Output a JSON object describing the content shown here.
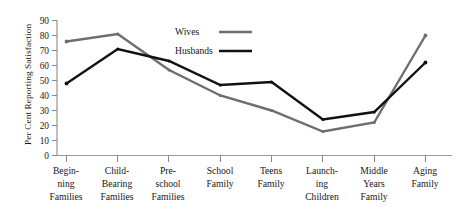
{
  "chart_data": {
    "type": "line",
    "title": "",
    "xlabel": "",
    "ylabel": "Per Cent Reporting Satisfaction",
    "ylim": [
      0,
      90
    ],
    "ytick_values": [
      0,
      10,
      20,
      30,
      40,
      50,
      60,
      70,
      80,
      90
    ],
    "ytick_labels": [
      "0",
      "10",
      "20",
      "30",
      "40",
      "50",
      "60",
      "70",
      "80",
      "90"
    ],
    "grid": false,
    "legend_position": "upper-center",
    "categories": [
      "Beginning Families",
      "Child-Bearing Families",
      "Pre-school Families",
      "School Family",
      "Teens Family",
      "Launching Children",
      "Middle Years Family",
      "Aging Family"
    ],
    "category_lines": [
      [
        "Begin-",
        "ning",
        "Families"
      ],
      [
        "Child-",
        "Bearing",
        "Families"
      ],
      [
        "Pre-",
        "school",
        "Families"
      ],
      [
        "School",
        "Family"
      ],
      [
        "Teens",
        "Family"
      ],
      [
        "Launch-",
        "ing",
        "Children"
      ],
      [
        "Middle",
        "Years",
        "Family"
      ],
      [
        "Aging",
        "Family"
      ]
    ],
    "series": [
      {
        "name": "Wives",
        "color": "#6e6e6e",
        "values": [
          76,
          81,
          57,
          40,
          30,
          16,
          22,
          80
        ]
      },
      {
        "name": "Husbands",
        "color": "#111111",
        "values": [
          48,
          71,
          63,
          47,
          49,
          24,
          29,
          62
        ]
      }
    ]
  },
  "axes": {
    "y_axis_label": "Per Cent Reporting Satisfaction",
    "y_ticks": [
      "90",
      "80",
      "70",
      "60",
      "50",
      "40",
      "30",
      "20",
      "10",
      "0"
    ]
  },
  "legend": {
    "entries": [
      {
        "label": "Wives",
        "color": "#6e6e6e"
      },
      {
        "label": "Husbands",
        "color": "#111111"
      }
    ]
  },
  "xcats": {
    "c0_l0": "Begin-",
    "c0_l1": "ning",
    "c0_l2": "Families",
    "c1_l0": "Child-",
    "c1_l1": "Bearing",
    "c1_l2": "Families",
    "c2_l0": "Pre-",
    "c2_l1": "school",
    "c2_l2": "Families",
    "c3_l0": "School",
    "c3_l1": "Family",
    "c3_l2": "",
    "c4_l0": "Teens",
    "c4_l1": "Family",
    "c4_l2": "",
    "c5_l0": "Launch-",
    "c5_l1": "ing",
    "c5_l2": "Children",
    "c6_l0": "Middle",
    "c6_l1": "Years",
    "c6_l2": "Family",
    "c7_l0": "Aging",
    "c7_l1": "Family",
    "c7_l2": ""
  },
  "yticks": {
    "t90": "90",
    "t80": "80",
    "t70": "70",
    "t60": "60",
    "t50": "50",
    "t40": "40",
    "t30": "30",
    "t20": "20",
    "t10": "10",
    "t0": "0"
  },
  "colors": {
    "wives_line": "#6e6e6e",
    "husbands_line": "#111111",
    "axis": "#8a8a8a",
    "text": "#161616",
    "background": "#ffffff"
  }
}
